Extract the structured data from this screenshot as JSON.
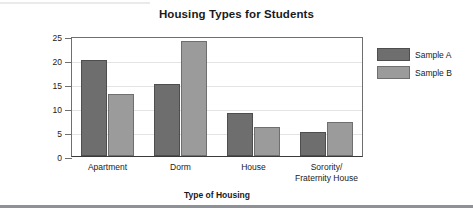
{
  "chart_data": {
    "type": "bar",
    "title": "Housing Types for Students",
    "xlabel": "Type of Housing",
    "ylabel": "Number of Students",
    "categories": [
      "Apartment",
      "Dorm",
      "House",
      "Sorority/\nFraternity House"
    ],
    "series": [
      {
        "name": "Sample A",
        "values": [
          20,
          15,
          9,
          5
        ],
        "color": "#6e6e6e"
      },
      {
        "name": "Sample B",
        "values": [
          13,
          24,
          6,
          7
        ],
        "color": "#9b9b9b"
      }
    ],
    "ylim": [
      0,
      25
    ],
    "yticks": [
      0,
      5,
      10,
      15,
      20,
      25
    ],
    "grid": true,
    "legend_position": "right"
  },
  "legend": {
    "items": [
      {
        "label": "Sample A"
      },
      {
        "label": "Sample B"
      }
    ]
  }
}
